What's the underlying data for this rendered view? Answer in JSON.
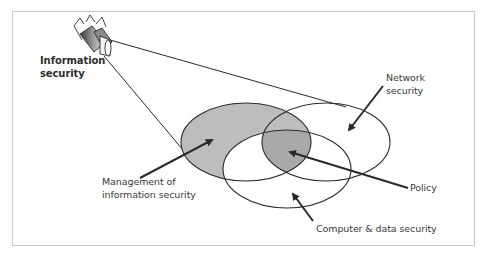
{
  "diagram": {
    "type": "venn",
    "camera": {
      "icon": "security-camera-icon",
      "label_lines": [
        "Information",
        "security"
      ]
    },
    "sets": [
      {
        "id": "management",
        "label_lines": [
          "Management of",
          "information security"
        ],
        "shaded": true
      },
      {
        "id": "network",
        "label_lines": [
          "Network",
          "security"
        ],
        "shaded": false
      },
      {
        "id": "computer",
        "label_lines": [
          "Computer & data security"
        ],
        "shaded": false
      }
    ],
    "intersections": [
      {
        "id": "policy",
        "label": "Policy",
        "between": [
          "management",
          "network",
          "computer"
        ],
        "shaded": true
      }
    ],
    "colors": {
      "shade_light": "#bdbdbd",
      "shade_dark": "#a9a9a9",
      "stroke": "#2b2b2b",
      "frame": "#c8c8c8",
      "text": "#3a3a3a"
    }
  }
}
